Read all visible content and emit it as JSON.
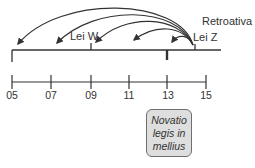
{
  "diagram": {
    "title_label": "Retroativa",
    "laws": [
      {
        "name": "Lei W",
        "year": "09"
      },
      {
        "name": "Lei Z",
        "year": "14"
      }
    ],
    "timeline_ticks": [
      "05",
      "07",
      "09",
      "11",
      "13",
      "15"
    ],
    "callout": {
      "lines": [
        "Novatio",
        "legis in",
        "mellius"
      ],
      "fill": "#dedede",
      "border": "#6e6e6e"
    },
    "arrows_from": "Lei Z",
    "arrow_targets": [
      "05",
      "07",
      "09",
      "11",
      "13"
    ],
    "colors": {
      "line": "#333333",
      "background": "#ffffff"
    }
  }
}
